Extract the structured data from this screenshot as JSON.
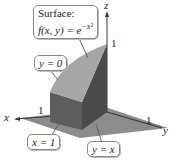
{
  "figure": {
    "callouts": {
      "surface_title": "Surface:",
      "surface_formula_lhs": "f(x, y) = e",
      "surface_formula_exp": "−x²",
      "plane_y0": "y = 0",
      "plane_x1": "x = 1",
      "plane_yx": "y = x"
    },
    "axes": {
      "x_label": "x",
      "y_label": "y",
      "z_label": "z",
      "x_tick": "1",
      "y_tick": "1",
      "z_tick": "1"
    },
    "colors": {
      "surface_top": "#a6a6a6",
      "front_face": "#5e5e5e",
      "side_face": "#4a4a4a",
      "base_plane": "#8c8c8c"
    }
  }
}
